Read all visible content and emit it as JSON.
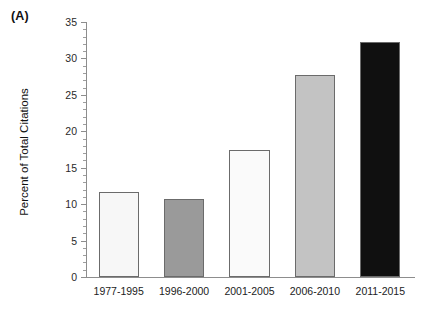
{
  "panel": {
    "label": "(A)"
  },
  "chart_data": {
    "type": "bar",
    "title": "",
    "subtitle": "",
    "xlabel": "",
    "ylabel": "Percent of Total Citations",
    "categories": [
      "1977-1995",
      "1996-2000",
      "2001-2005",
      "2006-2010",
      "2011-2015"
    ],
    "values": [
      11.7,
      10.7,
      17.4,
      27.7,
      32.3
    ],
    "bar_colors": [
      "#f7f7f7",
      "#9a9a9a",
      "#fafafa",
      "#c3c3c3",
      "#101010"
    ],
    "bar_edge_color": "#6b6b6b",
    "ylim": [
      0,
      35
    ],
    "yticks": [
      0,
      5,
      10,
      15,
      20,
      25,
      30,
      35
    ],
    "ytick_labels": [
      "0",
      "5",
      "10",
      "15",
      "20",
      "25",
      "30",
      "35"
    ],
    "minor_tick_step": 1,
    "grid": false,
    "legend": false,
    "legend_position": "none",
    "annotations": [
      "(A)"
    ]
  }
}
